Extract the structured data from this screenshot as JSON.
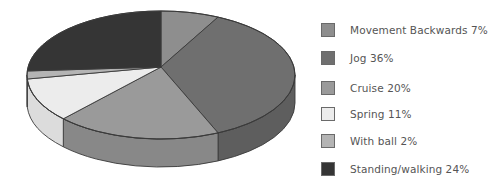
{
  "chart_data": {
    "type": "pie",
    "style": "3d",
    "title": "",
    "categories": [
      "Movement Backwards",
      "Jog",
      "Cruise",
      "Spring",
      "With ball",
      "Standing/walking"
    ],
    "values": [
      7,
      36,
      20,
      11,
      2,
      24
    ],
    "unit": "%",
    "legend_position": "right",
    "legend": [
      {
        "label": "Movement Backwards 7%",
        "color": "#8e8e8e"
      },
      {
        "label": "Jog 36%",
        "color": "#6f6f6f"
      },
      {
        "label": "Cruise 20%",
        "color": "#9a9a9a"
      },
      {
        "label": "Spring 11%",
        "color": "#ececec"
      },
      {
        "label": "With ball 2%",
        "color": "#b4b4b4"
      },
      {
        "label": "Standing/walking 24%",
        "color": "#353535"
      }
    ],
    "side_colors": [
      "#7a7a7a",
      "#5e5e5e",
      "#888888",
      "#dcdcdc",
      "#a2a2a2",
      "#2a2a2a"
    ]
  }
}
